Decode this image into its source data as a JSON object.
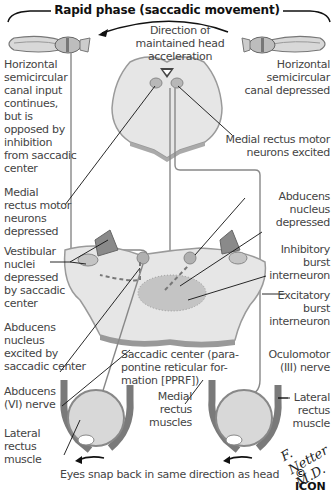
{
  "title": "Rapid phase (saccadic movement)",
  "direction_label": [
    "Direction of",
    "maintained head acceleration"
  ],
  "labels": {
    "left_canal": "Horizontal semicircular canal input continues, but is opposed by inhibition from saccadic center",
    "right_canal": "Horizontal semicircular canal depressed",
    "medial_rectus_excited": "Medial rectus motor neurons excited",
    "medial_rectus_depressed": "Medial rectus motor neurons depressed",
    "vestibular_nuclei": "Vestibular nuclei depressed by saccadic center",
    "abducens_depressed": "Abducens nucleus depressed",
    "inhibitory_burst": "Inhibitory burst interneuron",
    "excitatory_burst": "Excitatory burst interneuron",
    "abducens_excited": "Abducens nucleus excited by saccadic center",
    "saccadic_center": "Saccadic center (parapontine reticular formation [PPRF])",
    "oculomotor": "Oculomotor (III) nerve",
    "abducens_nerve": "Abducens (VI) nerve",
    "medial_rectus_muscles": "Medial rectus muscles",
    "lateral_rectus_left": "Lateral rectus muscle",
    "lateral_rectus_right": "Lateral rectus muscle",
    "caption": "Eyes snap back in same direction as head"
  },
  "lines": {
    "left_canal": [
      "Horizontal",
      "semicircular",
      "canal input",
      "continues,",
      "but is",
      "opposed by",
      "inhibition",
      "from saccadic",
      "center"
    ],
    "right_canal": [
      "Horizontal",
      "semicircular",
      "canal depressed"
    ],
    "medial_rectus_excited": [
      "Medial rectus motor",
      "neurons excited"
    ],
    "medial_rectus_depressed": [
      "Medial",
      "rectus motor",
      "neurons",
      "depressed"
    ],
    "vestibular_nuclei": [
      "Vestibular",
      "nuclei",
      "depressed",
      "by saccadic",
      "center"
    ],
    "abducens_depressed": [
      "Abducens",
      "nucleus",
      "depressed"
    ],
    "inhibitory_burst": [
      "Inhibitory",
      "burst",
      "interneuron"
    ],
    "excitatory_burst": [
      "Excitatory",
      "burst",
      "interneuron"
    ],
    "abducens_excited": [
      "Abducens",
      "nucleus",
      "excited by",
      "saccadic center"
    ],
    "saccadic_center": [
      "Saccadic center (para-",
      "pontine reticular for-",
      "mation [PPRF])"
    ],
    "oculomotor": [
      "Oculomotor",
      "(III) nerve"
    ],
    "abducens_nerve": [
      "Abducens",
      "(VI) nerve"
    ],
    "medial_rectus_muscles": [
      "Medial",
      "rectus",
      "muscles"
    ],
    "lateral_rectus_left": [
      "Lateral",
      "rectus",
      "muscle"
    ],
    "lateral_rectus_right": [
      "Lateral",
      "rectus",
      "muscle"
    ]
  },
  "signature": "F. Netter M.D.",
  "copyright": "© ICON",
  "colors": {
    "tissue": "#e6e6e6",
    "tissue_edge": "#9a9a9a",
    "nucleus": "#b8b8b8",
    "muscle": "#8a8a8a",
    "eye": "#d8d8d8",
    "nerve": "#888888",
    "text": "#444444"
  }
}
